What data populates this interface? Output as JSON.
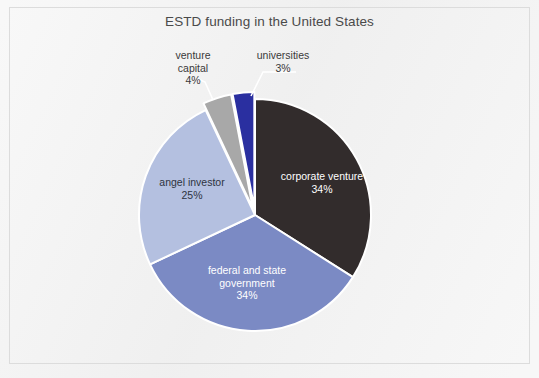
{
  "chart_data": {
    "type": "pie",
    "title": "ESTD funding in the United States",
    "xlabel": "",
    "ylabel": "",
    "legend": "none",
    "grid": false,
    "units": "percent",
    "categories": [
      "corporate venture",
      "federal and state government",
      "angel investor",
      "venture capital",
      "universities"
    ],
    "values": [
      34,
      34,
      25,
      4,
      3
    ],
    "value_labels": [
      "34%",
      "34%",
      "25%",
      "4%",
      "3%"
    ],
    "colors": [
      "#322c2c",
      "#7b8ac4",
      "#b4c0e0",
      "#a8a8a8",
      "#2a2fa0"
    ],
    "slices": [
      {
        "name": "corporate venture",
        "label": "corporate venture",
        "value": 34,
        "value_label": "34%",
        "color": "#322c2c",
        "label_placement": "inside",
        "label_color": "#ffffff",
        "exploded": false,
        "start_angle_deg": 0,
        "end_angle_deg": 122.4
      },
      {
        "name": "federal and state government",
        "label": "federal and state\ngovernment",
        "value": 34,
        "value_label": "34%",
        "color": "#7b8ac4",
        "label_placement": "inside",
        "label_color": "#ffffff",
        "exploded": false,
        "start_angle_deg": 122.4,
        "end_angle_deg": 244.8
      },
      {
        "name": "angel investor",
        "label": "angel investor",
        "value": 25,
        "value_label": "25%",
        "color": "#b4c0e0",
        "label_placement": "inside",
        "label_color": "#2e3440",
        "exploded": false,
        "start_angle_deg": 244.8,
        "end_angle_deg": 334.8
      },
      {
        "name": "venture capital",
        "label": "venture\ncapital",
        "value": 4,
        "value_label": "4%",
        "color": "#a8a8a8",
        "label_placement": "callout",
        "label_color": "#3a3a3a",
        "exploded": true,
        "start_angle_deg": 334.8,
        "end_angle_deg": 349.2
      },
      {
        "name": "universities",
        "label": "universities",
        "value": 3,
        "value_label": "3%",
        "color": "#2a2fa0",
        "label_placement": "callout",
        "label_color": "#3a3a3a",
        "exploded": true,
        "start_angle_deg": 349.2,
        "end_angle_deg": 360
      }
    ]
  },
  "labels": {
    "corporate_venture": "corporate venture\n34%",
    "federal_state_government": "federal and state\ngovernment\n34%",
    "angel_investor": "angel investor\n25%",
    "venture_capital": "venture\ncapital\n4%",
    "universities": "universities\n3%"
  },
  "style": {
    "page_background": "#f0f0f0",
    "frame_border": "#dcdcdc",
    "title_color": "#4a4a4a",
    "slice_separator": "#ffffff",
    "leader_line": "#ffffff"
  }
}
